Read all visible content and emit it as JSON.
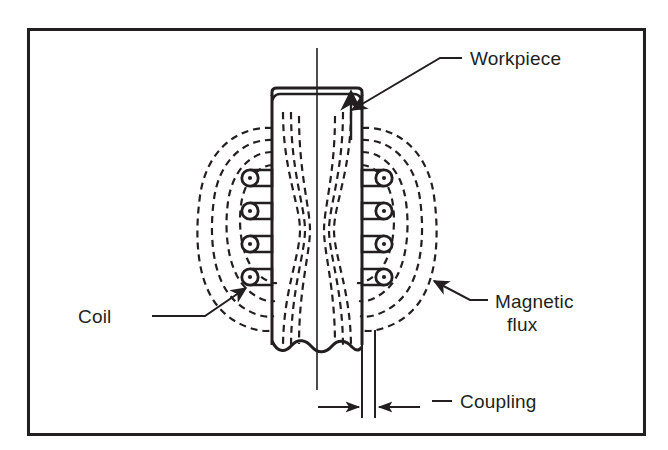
{
  "figure": {
    "type": "technical-line-diagram",
    "background_color": "#ffffff",
    "line_color": "#231f20",
    "frame": {
      "x": 27,
      "y": 28,
      "width": 618,
      "height": 407,
      "stroke_width": 3
    }
  },
  "labels": {
    "workpiece": "Workpiece",
    "coil": "Coil",
    "magnetic_flux_line1": "Magnetic",
    "magnetic_flux_line2": "flux",
    "coupling": "Coupling"
  },
  "components": {
    "workpiece": {
      "name": "workpiece",
      "left_edge_x": 272,
      "right_edge_x": 362,
      "top_y": 88,
      "bottom_break_y": 348,
      "centerline_x": 317,
      "has_break_line": true,
      "has_double_top_edge": true
    },
    "coil": {
      "name": "coil",
      "turns_per_side": 4,
      "current_symbol": "dot-out-of-page",
      "left_turn_x": 250,
      "right_turn_x": 384,
      "turn_y_positions": [
        178,
        211,
        244,
        277
      ],
      "circle_radius": 8,
      "dot_radius": 2
    },
    "magnetic_flux": {
      "name": "magnetic-flux",
      "style": "dashed",
      "loops_per_side": 4,
      "has_arrowhead": true,
      "center_converging_lines": true
    },
    "coupling": {
      "name": "coupling-dimension",
      "gap_left_x": 362,
      "gap_right_x": 375,
      "dimension_y": 407,
      "arrow_direction": "inward"
    }
  },
  "leaders": {
    "workpiece": {
      "label_x": 470,
      "label_y": 63,
      "dash_x1": 440,
      "dash_x2": 462,
      "bend_x": 440,
      "arrow_tip_x": 348,
      "arrow_tip_y": 112
    },
    "coil": {
      "label_x": 80,
      "label_y": 322,
      "line_x1": 155,
      "line_x2": 205,
      "line_y": 316,
      "arrow_tip_x": 243,
      "arrow_tip_y": 285
    },
    "magnetic_flux": {
      "label_x": 493,
      "label_y1": 307,
      "label_y2": 330,
      "line_x1": 470,
      "line_x2": 488,
      "line_y": 300,
      "arrow_tip_x": 430,
      "arrow_tip_y": 283
    },
    "coupling": {
      "label_x": 458,
      "label_y": 393,
      "line_x1": 432,
      "line_x2": 452,
      "line_y": 387
    }
  }
}
